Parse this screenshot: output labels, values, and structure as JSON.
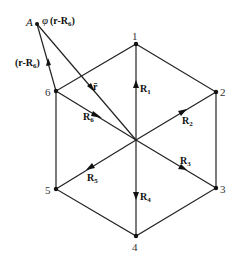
{
  "diagram": {
    "title": "",
    "center": {
      "x": 136,
      "y": 140
    },
    "point_A": {
      "label": "A",
      "x": 37,
      "y": 24,
      "phi_label": "φ",
      "phi_expr": "(r-R",
      "phi_sub": "6",
      "phi_close": ")"
    },
    "vector_r_minus_R6": {
      "prefix": "(r-R",
      "sub": "6",
      "suffix": ")"
    },
    "vector_r": {
      "label": "r̄"
    },
    "vertices": [
      {
        "id": "1",
        "label": "1",
        "x": 136,
        "y": 44
      },
      {
        "id": "2",
        "label": "2",
        "x": 216,
        "y": 92
      },
      {
        "id": "3",
        "label": "3",
        "x": 216,
        "y": 188
      },
      {
        "id": "4",
        "label": "4",
        "x": 136,
        "y": 236
      },
      {
        "id": "5",
        "label": "5",
        "x": 56,
        "y": 189
      },
      {
        "id": "6",
        "label": "6",
        "x": 56,
        "y": 91
      }
    ],
    "vectors": [
      {
        "name": "R",
        "sub": "1"
      },
      {
        "name": "R",
        "sub": "2"
      },
      {
        "name": "R",
        "sub": "3"
      },
      {
        "name": "R",
        "sub": "4"
      },
      {
        "name": "R",
        "sub": "5"
      },
      {
        "name": "R",
        "sub": "6"
      }
    ]
  }
}
